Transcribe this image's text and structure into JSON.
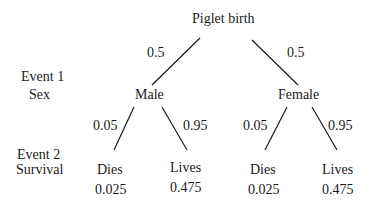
{
  "root": {
    "label": "Piglet birth"
  },
  "rows": {
    "event1": {
      "line1": "Event 1",
      "line2": "Sex"
    },
    "event2": {
      "line1": "Event 2",
      "line2": "Survival"
    }
  },
  "level1": {
    "male": {
      "label": "Male",
      "prob": "0.5"
    },
    "female": {
      "label": "Female",
      "prob": "0.5"
    }
  },
  "level2": {
    "male_dies": {
      "label": "Dies",
      "branch_prob": "0.05",
      "joint_prob": "0.025"
    },
    "male_lives": {
      "label": "Lives",
      "branch_prob": "0.95",
      "joint_prob": "0.475"
    },
    "female_dies": {
      "label": "Dies",
      "branch_prob": "0.05",
      "joint_prob": "0.025"
    },
    "female_lives": {
      "label": "Lives",
      "branch_prob": "0.95",
      "joint_prob": "0.475"
    }
  }
}
